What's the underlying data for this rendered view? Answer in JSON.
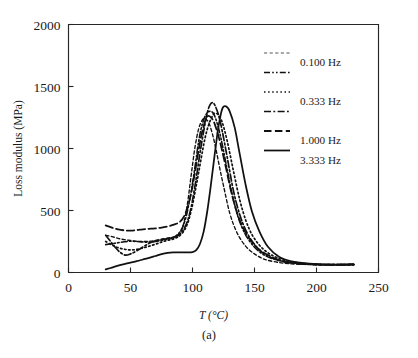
{
  "figure": {
    "caption": "(a)",
    "background_color": "#ffffff",
    "line_color": "#111111",
    "muted_line_color": "#8f8f8f"
  },
  "chart_data": {
    "type": "line",
    "title": "",
    "subtitle": "",
    "xlabel": "T (°C)",
    "ylabel": "Loss modulus (MPa)",
    "xlim": [
      0,
      250
    ],
    "ylim": [
      0,
      2000
    ],
    "xticks": [
      0,
      50,
      100,
      150,
      200,
      250
    ],
    "xticklabels": [
      "0",
      "50",
      "100",
      "150",
      "200",
      "250"
    ],
    "yticks": [
      0,
      500,
      1000,
      1500,
      2000
    ],
    "yticklabels": [
      "0",
      "500",
      "1000",
      "1500",
      "2000"
    ],
    "grid": false,
    "legend_position": "upper right",
    "legend_entries": [
      "0.100 Hz",
      "0.333 Hz",
      "1.000 Hz",
      "3.333 Hz"
    ],
    "series": [
      {
        "name": "0.100 Hz",
        "label": "0.100 Hz",
        "linestyle": "fine-dash",
        "color": "#8f8f8f",
        "peak_x": 110,
        "peak_y": 1240,
        "x": [
          30,
          35,
          40,
          45,
          50,
          55,
          60,
          65,
          70,
          75,
          80,
          85,
          90,
          93,
          96,
          99,
          102,
          105,
          108,
          110,
          113,
          116,
          119,
          122,
          125,
          130,
          135,
          140,
          145,
          150,
          155,
          160,
          170,
          180,
          190,
          200,
          210,
          220,
          230
        ],
        "y": [
          300,
          290,
          275,
          265,
          258,
          252,
          250,
          252,
          258,
          268,
          278,
          288,
          320,
          400,
          560,
          790,
          1010,
          1160,
          1230,
          1240,
          1210,
          1120,
          990,
          840,
          700,
          480,
          340,
          250,
          190,
          150,
          120,
          100,
          80,
          70,
          65,
          62,
          62,
          62,
          63
        ]
      },
      {
        "name": "unlabeled-intermediate",
        "label": "",
        "linestyle": "dash-dot-dot",
        "color": "#111111",
        "peak_x": 114,
        "peak_y": 1300,
        "x": [
          30,
          35,
          40,
          45,
          50,
          55,
          60,
          65,
          70,
          75,
          80,
          85,
          90,
          94,
          98,
          102,
          105,
          108,
          111,
          114,
          117,
          120,
          123,
          127,
          132,
          137,
          142,
          147,
          152,
          158,
          165,
          175,
          185,
          195,
          205,
          215,
          225,
          230
        ],
        "y": [
          225,
          232,
          240,
          248,
          252,
          250,
          246,
          245,
          250,
          258,
          270,
          285,
          330,
          420,
          600,
          850,
          1060,
          1200,
          1275,
          1300,
          1280,
          1200,
          1080,
          880,
          630,
          440,
          320,
          240,
          185,
          140,
          110,
          85,
          72,
          66,
          63,
          62,
          63,
          64
        ]
      },
      {
        "name": "0.333 Hz",
        "label": "0.333 Hz",
        "linestyle": "dotted",
        "color": "#111111",
        "peak_x": 118,
        "peak_y": 1285,
        "x": [
          30,
          35,
          40,
          45,
          50,
          55,
          60,
          65,
          70,
          75,
          80,
          85,
          90,
          95,
          99,
          103,
          107,
          110,
          113,
          116,
          118,
          121,
          124,
          128,
          133,
          138,
          143,
          148,
          154,
          160,
          168,
          178,
          188,
          198,
          210,
          220,
          230
        ],
        "y": [
          250,
          222,
          200,
          188,
          182,
          186,
          198,
          212,
          228,
          245,
          260,
          272,
          300,
          370,
          500,
          700,
          920,
          1080,
          1190,
          1260,
          1285,
          1270,
          1210,
          1060,
          820,
          590,
          420,
          305,
          220,
          165,
          120,
          90,
          74,
          66,
          63,
          63,
          64
        ]
      },
      {
        "name": "1.000 Hz",
        "label": "1.000 Hz",
        "linestyle": "dash-dot",
        "color": "#111111",
        "peak_x": 116,
        "peak_y": 1370,
        "x": [
          30,
          34,
          38,
          42,
          46,
          50,
          55,
          60,
          65,
          70,
          75,
          80,
          85,
          90,
          95,
          99,
          103,
          106,
          109,
          112,
          114,
          116,
          118,
          121,
          124,
          128,
          133,
          138,
          143,
          149,
          156,
          164,
          174,
          185,
          196,
          208,
          220,
          230
        ],
        "y": [
          300,
          250,
          200,
          160,
          140,
          150,
          175,
          205,
          235,
          255,
          265,
          272,
          282,
          310,
          390,
          530,
          760,
          960,
          1140,
          1290,
          1350,
          1370,
          1350,
          1270,
          1140,
          930,
          660,
          470,
          340,
          240,
          165,
          118,
          88,
          72,
          66,
          63,
          63,
          64
        ]
      },
      {
        "name": "3.333 Hz",
        "label": "3.333 Hz",
        "linestyle": "solid",
        "color": "#111111",
        "peak_x": 124,
        "peak_y": 1340,
        "x": [
          30,
          35,
          40,
          45,
          50,
          55,
          60,
          65,
          70,
          75,
          80,
          85,
          90,
          95,
          100,
          103,
          106,
          109,
          112,
          115,
          118,
          121,
          124,
          127,
          130,
          134,
          138,
          143,
          148,
          154,
          161,
          170,
          180,
          192,
          205,
          218,
          230
        ],
        "y": [
          25,
          40,
          55,
          68,
          80,
          92,
          105,
          118,
          133,
          148,
          158,
          162,
          163,
          163,
          165,
          180,
          230,
          330,
          500,
          720,
          960,
          1180,
          1320,
          1340,
          1300,
          1170,
          960,
          700,
          490,
          330,
          205,
          125,
          90,
          73,
          66,
          64,
          68
        ]
      },
      {
        "name": "long-dash-baseline",
        "label": "",
        "linestyle": "long-dash",
        "color": "#111111",
        "peak_x": 112,
        "peak_y": 1260,
        "x": [
          30,
          35,
          40,
          45,
          50,
          55,
          60,
          65,
          70,
          75,
          80,
          85,
          90,
          94,
          98,
          101,
          104,
          107,
          110,
          112,
          115,
          118,
          122,
          126,
          131,
          136,
          141,
          147,
          153,
          160,
          170,
          182,
          195,
          210,
          225,
          230
        ],
        "y": [
          380,
          362,
          348,
          340,
          338,
          342,
          348,
          352,
          356,
          362,
          372,
          386,
          410,
          470,
          600,
          750,
          930,
          1100,
          1215,
          1260,
          1250,
          1195,
          1060,
          890,
          660,
          480,
          355,
          258,
          192,
          145,
          100,
          78,
          68,
          63,
          63,
          64
        ]
      }
    ]
  },
  "legend": {
    "items": [
      {
        "sample": "fine-dash",
        "label": "0.100 Hz",
        "color": "#8f8f8f"
      },
      {
        "sample": "dash-dot-dot",
        "label": "",
        "color": "#111111"
      },
      {
        "sample": "dotted",
        "label": "0.333 Hz",
        "color": "#111111"
      },
      {
        "sample": "dash-dot",
        "label": "",
        "color": "#111111"
      },
      {
        "sample": "long-dash",
        "label": "1.000 Hz",
        "color": "#111111"
      },
      {
        "sample": "solid",
        "label": "3.333 Hz",
        "color": "#111111"
      }
    ]
  }
}
